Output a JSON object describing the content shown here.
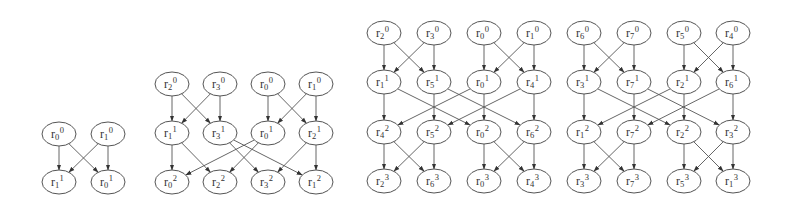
{
  "diagram": {
    "type": "butterfly-graphs",
    "style": {
      "stroke": "#555555",
      "text": "#333333",
      "background": "#ffffff"
    },
    "graphs": [
      {
        "name": "graph-2",
        "levels": [
          [
            {
              "id": "r0_0",
              "base": "r",
              "sub": "0",
              "sup": "0",
              "x": 59,
              "y": 134
            },
            {
              "id": "r1_0",
              "base": "r",
              "sub": "1",
              "sup": "0",
              "x": 108,
              "y": 134
            }
          ],
          [
            {
              "id": "r1_1",
              "base": "r",
              "sub": "1",
              "sup": "1",
              "x": 59,
              "y": 182
            },
            {
              "id": "r0_1",
              "base": "r",
              "sub": "0",
              "sup": "1",
              "x": 108,
              "y": 182
            }
          ]
        ],
        "edges": [
          [
            "r0_0",
            "r1_1"
          ],
          [
            "r0_0",
            "r0_1"
          ],
          [
            "r1_0",
            "r1_1"
          ],
          [
            "r1_0",
            "r0_1"
          ]
        ]
      },
      {
        "name": "graph-4",
        "levels": [
          [
            {
              "id": "r2_0",
              "base": "r",
              "sub": "2",
              "sup": "0",
              "x": 172,
              "y": 84
            },
            {
              "id": "r3_0",
              "base": "r",
              "sub": "3",
              "sup": "0",
              "x": 220,
              "y": 84
            },
            {
              "id": "r0_0",
              "base": "r",
              "sub": "0",
              "sup": "0",
              "x": 268,
              "y": 84
            },
            {
              "id": "r1_0",
              "base": "r",
              "sub": "1",
              "sup": "0",
              "x": 316,
              "y": 84
            }
          ],
          [
            {
              "id": "r1_1",
              "base": "r",
              "sub": "1",
              "sup": "1",
              "x": 172,
              "y": 133
            },
            {
              "id": "r3_1",
              "base": "r",
              "sub": "3",
              "sup": "1",
              "x": 220,
              "y": 133
            },
            {
              "id": "r0_1",
              "base": "r",
              "sub": "0",
              "sup": "1",
              "x": 268,
              "y": 133
            },
            {
              "id": "r2_1",
              "base": "r",
              "sub": "2",
              "sup": "1",
              "x": 316,
              "y": 133
            }
          ],
          [
            {
              "id": "r0_2",
              "base": "r",
              "sub": "0",
              "sup": "2",
              "x": 172,
              "y": 182
            },
            {
              "id": "r2_2",
              "base": "r",
              "sub": "2",
              "sup": "2",
              "x": 220,
              "y": 182
            },
            {
              "id": "r3_2",
              "base": "r",
              "sub": "3",
              "sup": "2",
              "x": 268,
              "y": 182
            },
            {
              "id": "r1_2",
              "base": "r",
              "sub": "1",
              "sup": "2",
              "x": 316,
              "y": 182
            }
          ]
        ],
        "edges": [
          [
            "r2_0",
            "r1_1"
          ],
          [
            "r2_0",
            "r3_1"
          ],
          [
            "r3_0",
            "r1_1"
          ],
          [
            "r3_0",
            "r3_1"
          ],
          [
            "r0_0",
            "r0_1"
          ],
          [
            "r0_0",
            "r2_1"
          ],
          [
            "r1_0",
            "r0_1"
          ],
          [
            "r1_0",
            "r2_1"
          ],
          [
            "r1_1",
            "r0_2"
          ],
          [
            "r1_1",
            "r2_2"
          ],
          [
            "r3_1",
            "r3_2"
          ],
          [
            "r3_1",
            "r1_2"
          ],
          [
            "r0_1",
            "r0_2"
          ],
          [
            "r0_1",
            "r2_2"
          ],
          [
            "r2_1",
            "r3_2"
          ],
          [
            "r2_1",
            "r1_2"
          ]
        ]
      },
      {
        "name": "graph-8",
        "levels": [
          [
            {
              "id": "r2_0",
              "base": "r",
              "sub": "2",
              "sup": "0",
              "x": 384,
              "y": 33
            },
            {
              "id": "r3_0",
              "base": "r",
              "sub": "3",
              "sup": "0",
              "x": 434,
              "y": 33
            },
            {
              "id": "r0_0",
              "base": "r",
              "sub": "0",
              "sup": "0",
              "x": 484,
              "y": 33
            },
            {
              "id": "r1_0",
              "base": "r",
              "sub": "1",
              "sup": "0",
              "x": 534,
              "y": 33
            },
            {
              "id": "r6_0",
              "base": "r",
              "sub": "6",
              "sup": "0",
              "x": 584,
              "y": 33
            },
            {
              "id": "r7_0",
              "base": "r",
              "sub": "7",
              "sup": "0",
              "x": 634,
              "y": 33
            },
            {
              "id": "r5_0",
              "base": "r",
              "sub": "5",
              "sup": "0",
              "x": 684,
              "y": 33
            },
            {
              "id": "r4_0",
              "base": "r",
              "sub": "4",
              "sup": "0",
              "x": 733,
              "y": 33
            }
          ],
          [
            {
              "id": "r1_1",
              "base": "r",
              "sub": "1",
              "sup": "1",
              "x": 384,
              "y": 82
            },
            {
              "id": "r5_1",
              "base": "r",
              "sub": "5",
              "sup": "1",
              "x": 434,
              "y": 82
            },
            {
              "id": "r0_1",
              "base": "r",
              "sub": "0",
              "sup": "1",
              "x": 484,
              "y": 82
            },
            {
              "id": "r4_1",
              "base": "r",
              "sub": "4",
              "sup": "1",
              "x": 534,
              "y": 82
            },
            {
              "id": "r3_1",
              "base": "r",
              "sub": "3",
              "sup": "1",
              "x": 584,
              "y": 82
            },
            {
              "id": "r7_1",
              "base": "r",
              "sub": "7",
              "sup": "1",
              "x": 634,
              "y": 82
            },
            {
              "id": "r2_1",
              "base": "r",
              "sub": "2",
              "sup": "1",
              "x": 684,
              "y": 82
            },
            {
              "id": "r6_1",
              "base": "r",
              "sub": "6",
              "sup": "1",
              "x": 733,
              "y": 82
            }
          ],
          [
            {
              "id": "r4_2",
              "base": "r",
              "sub": "4",
              "sup": "2",
              "x": 384,
              "y": 132
            },
            {
              "id": "r5_2",
              "base": "r",
              "sub": "5",
              "sup": "2",
              "x": 434,
              "y": 132
            },
            {
              "id": "r0_2",
              "base": "r",
              "sub": "0",
              "sup": "2",
              "x": 484,
              "y": 132
            },
            {
              "id": "r6_2",
              "base": "r",
              "sub": "6",
              "sup": "2",
              "x": 534,
              "y": 132
            },
            {
              "id": "r1_2",
              "base": "r",
              "sub": "1",
              "sup": "2",
              "x": 584,
              "y": 132
            },
            {
              "id": "r7_2",
              "base": "r",
              "sub": "7",
              "sup": "2",
              "x": 634,
              "y": 132
            },
            {
              "id": "r2_2",
              "base": "r",
              "sub": "2",
              "sup": "2",
              "x": 684,
              "y": 132
            },
            {
              "id": "r3_2",
              "base": "r",
              "sub": "3",
              "sup": "2",
              "x": 733,
              "y": 132
            }
          ],
          [
            {
              "id": "r2_3",
              "base": "r",
              "sub": "2",
              "sup": "3",
              "x": 384,
              "y": 181
            },
            {
              "id": "r6_3",
              "base": "r",
              "sub": "6",
              "sup": "3",
              "x": 434,
              "y": 181
            },
            {
              "id": "r0_3",
              "base": "r",
              "sub": "0",
              "sup": "3",
              "x": 484,
              "y": 181
            },
            {
              "id": "r4_3",
              "base": "r",
              "sub": "4",
              "sup": "3",
              "x": 534,
              "y": 181
            },
            {
              "id": "r7_3",
              "base": "r",
              "sub": "7",
              "sup": "3",
              "x": 634,
              "y": 181
            },
            {
              "id": "r3_3",
              "base": "r",
              "sub": "3",
              "sup": "3",
              "x": 584,
              "y": 181
            },
            {
              "id": "r5_3",
              "base": "r",
              "sub": "5",
              "sup": "3",
              "x": 684,
              "y": 181
            },
            {
              "id": "r1_3",
              "base": "r",
              "sub": "1",
              "sup": "3",
              "x": 733,
              "y": 181
            }
          ]
        ],
        "edges": [
          [
            "r2_0",
            "r1_1"
          ],
          [
            "r2_0",
            "r5_1"
          ],
          [
            "r3_0",
            "r1_1"
          ],
          [
            "r3_0",
            "r5_1"
          ],
          [
            "r0_0",
            "r0_1"
          ],
          [
            "r0_0",
            "r4_1"
          ],
          [
            "r1_0",
            "r0_1"
          ],
          [
            "r1_0",
            "r4_1"
          ],
          [
            "r6_0",
            "r3_1"
          ],
          [
            "r6_0",
            "r7_1"
          ],
          [
            "r7_0",
            "r3_1"
          ],
          [
            "r7_0",
            "r7_1"
          ],
          [
            "r5_0",
            "r2_1"
          ],
          [
            "r5_0",
            "r6_1"
          ],
          [
            "r4_0",
            "r2_1"
          ],
          [
            "r4_0",
            "r6_1"
          ],
          [
            "r1_1",
            "r4_2"
          ],
          [
            "r1_1",
            "r0_2"
          ],
          [
            "r5_1",
            "r5_2"
          ],
          [
            "r5_1",
            "r6_2"
          ],
          [
            "r0_1",
            "r4_2"
          ],
          [
            "r0_1",
            "r0_2"
          ],
          [
            "r4_1",
            "r5_2"
          ],
          [
            "r4_1",
            "r6_2"
          ],
          [
            "r3_1",
            "r1_2"
          ],
          [
            "r3_1",
            "r2_2"
          ],
          [
            "r7_1",
            "r7_2"
          ],
          [
            "r7_1",
            "r3_2"
          ],
          [
            "r2_1",
            "r1_2"
          ],
          [
            "r2_1",
            "r2_2"
          ],
          [
            "r6_1",
            "r7_2"
          ],
          [
            "r6_1",
            "r3_2"
          ],
          [
            "r4_2",
            "r2_3"
          ],
          [
            "r4_2",
            "r6_3"
          ],
          [
            "r5_2",
            "r2_3"
          ],
          [
            "r5_2",
            "r6_3"
          ],
          [
            "r0_2",
            "r0_3"
          ],
          [
            "r0_2",
            "r4_3"
          ],
          [
            "r6_2",
            "r0_3"
          ],
          [
            "r6_2",
            "r4_3"
          ],
          [
            "r1_2",
            "r7_3"
          ],
          [
            "r1_2",
            "r3_3"
          ],
          [
            "r7_2",
            "r7_3"
          ],
          [
            "r7_2",
            "r3_3"
          ],
          [
            "r2_2",
            "r5_3"
          ],
          [
            "r2_2",
            "r1_3"
          ],
          [
            "r3_2",
            "r5_3"
          ],
          [
            "r3_2",
            "r1_3"
          ]
        ]
      }
    ]
  }
}
